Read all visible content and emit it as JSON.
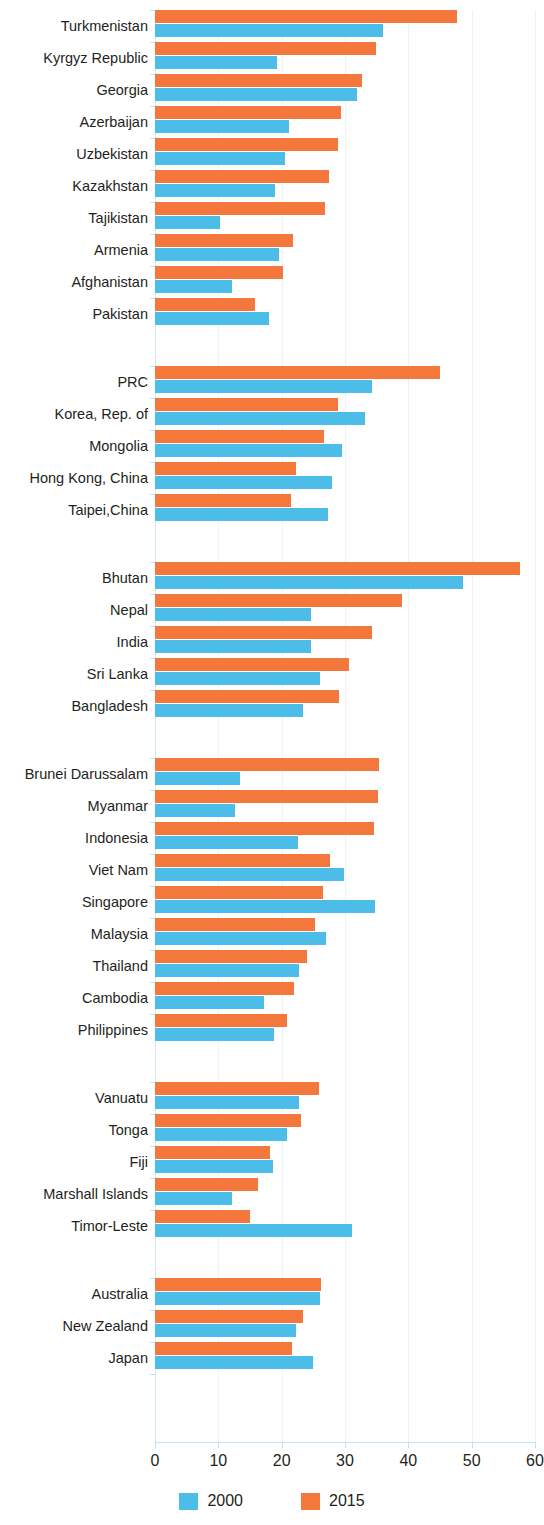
{
  "chart_data": {
    "type": "bar",
    "orientation": "horizontal",
    "title": "",
    "subtitle": "",
    "xlabel": "",
    "ylabel": "",
    "xlim": [
      0,
      60
    ],
    "xticks": [
      0,
      10,
      20,
      30,
      40,
      50,
      60
    ],
    "xtick_labels": [
      "0",
      "10",
      "20",
      "30",
      "40",
      "50",
      "60"
    ],
    "grid": true,
    "legend_position": "bottom-center",
    "colors": {
      "series_2000": "#4cbce8",
      "series_2015": "#f4783c",
      "gridline": "#e8f4fa",
      "axis": "#bfe3f2",
      "text": "#231f20"
    },
    "legend": [
      {
        "label": "2000",
        "color": "#4cbce8"
      },
      {
        "label": "2015",
        "color": "#f4783c"
      }
    ],
    "series": [
      {
        "name": "2000",
        "color": "#4cbce8"
      },
      {
        "name": "2015",
        "color": "#f4783c"
      }
    ],
    "groups": [
      {
        "name": "",
        "rows": [
          {
            "category": "Turkmenistan",
            "2000": 36.0,
            "2015": 47.7
          },
          {
            "category": "Kyrgyz Republic",
            "2000": 19.2,
            "2015": 34.9
          },
          {
            "category": "Georgia",
            "2000": 31.9,
            "2015": 32.7
          },
          {
            "category": "Azerbaijan",
            "2000": 21.2,
            "2015": 29.4
          },
          {
            "category": "Uzbekistan",
            "2000": 20.6,
            "2015": 28.9
          },
          {
            "category": "Kazakhstan",
            "2000": 18.9,
            "2015": 27.4
          },
          {
            "category": "Tajikistan",
            "2000": 10.2,
            "2015": 26.9
          },
          {
            "category": "Armenia",
            "2000": 19.5,
            "2015": 21.8
          },
          {
            "category": "Afghanistan",
            "2000": 12.1,
            "2015": 20.2
          },
          {
            "category": "Pakistan",
            "2000": 18.0,
            "2015": 15.8
          }
        ]
      },
      {
        "name": "",
        "rows": [
          {
            "category": "PRC",
            "2000": 34.2,
            "2015": 45.0
          },
          {
            "category": "Korea, Rep. of",
            "2000": 33.2,
            "2015": 28.9
          },
          {
            "category": "Mongolia",
            "2000": 29.5,
            "2015": 26.7
          },
          {
            "category": "Hong Kong, China",
            "2000": 28.0,
            "2015": 22.3
          },
          {
            "category": "Taipei,China",
            "2000": 27.3,
            "2015": 21.5
          }
        ]
      },
      {
        "name": "",
        "rows": [
          {
            "category": "Bhutan",
            "2000": 48.7,
            "2015": 57.7
          },
          {
            "category": "Nepal",
            "2000": 24.6,
            "2015": 39.0
          },
          {
            "category": "India",
            "2000": 24.6,
            "2015": 34.3
          },
          {
            "category": "Sri Lanka",
            "2000": 26.0,
            "2015": 30.6
          },
          {
            "category": "Bangladesh",
            "2000": 23.3,
            "2015": 29.1
          }
        ]
      },
      {
        "name": "",
        "rows": [
          {
            "category": "Brunei Darussalam",
            "2000": 13.4,
            "2015": 35.3
          },
          {
            "category": "Myanmar",
            "2000": 12.7,
            "2015": 35.2
          },
          {
            "category": "Indonesia",
            "2000": 22.5,
            "2015": 34.6
          },
          {
            "category": "Viet Nam",
            "2000": 29.9,
            "2015": 27.7
          },
          {
            "category": "Singapore",
            "2000": 34.7,
            "2015": 26.5
          },
          {
            "category": "Malaysia",
            "2000": 27.0,
            "2015": 25.3
          },
          {
            "category": "Thailand",
            "2000": 22.8,
            "2015": 24.0
          },
          {
            "category": "Cambodia",
            "2000": 17.2,
            "2015": 22.0
          },
          {
            "category": "Philippines",
            "2000": 18.8,
            "2015": 20.8
          }
        ]
      },
      {
        "name": "",
        "rows": [
          {
            "category": "Vanuatu",
            "2000": 22.7,
            "2015": 25.9
          },
          {
            "category": "Tonga",
            "2000": 20.9,
            "2015": 23.0
          },
          {
            "category": "Fiji",
            "2000": 18.6,
            "2015": 18.2
          },
          {
            "category": "Marshall Islands",
            "2000": 12.2,
            "2015": 16.3
          },
          {
            "category": "Timor-Leste",
            "2000": 31.1,
            "2015": 15.0
          }
        ]
      },
      {
        "name": "",
        "rows": [
          {
            "category": "Australia",
            "2000": 26.1,
            "2015": 26.2
          },
          {
            "category": "New Zealand",
            "2000": 22.3,
            "2015": 23.3
          },
          {
            "category": "Japan",
            "2000": 24.9,
            "2015": 21.6
          }
        ]
      }
    ]
  }
}
